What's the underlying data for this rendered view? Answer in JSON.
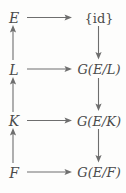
{
  "diagram": {
    "text_color": "#4a4a4a",
    "arrow_color": "#6e6e6e",
    "background_color": "#fdfdfc",
    "rows": [
      {
        "left_label": "E",
        "right_label": "{id}",
        "horizontal_arrow": "right"
      },
      {
        "left_label": "L",
        "right_label": "G(E/L)",
        "horizontal_arrow": "right"
      },
      {
        "left_label": "K",
        "right_label": "G(E/K)",
        "horizontal_arrow": "right"
      },
      {
        "left_label": "F",
        "right_label": "G(E/F)",
        "horizontal_arrow": "right"
      }
    ],
    "left_column_arrows": [
      {
        "from": "L",
        "to": "E",
        "direction": "up"
      },
      {
        "from": "K",
        "to": "L",
        "direction": "up"
      },
      {
        "from": "F",
        "to": "K",
        "direction": "up"
      }
    ],
    "right_column_arrows": [
      {
        "from": "{id}",
        "to": "G(E/L)",
        "direction": "down"
      },
      {
        "from": "G(E/L)",
        "to": "G(E/K)",
        "direction": "down"
      },
      {
        "from": "G(E/K)",
        "to": "G(E/F)",
        "direction": "down"
      }
    ]
  }
}
